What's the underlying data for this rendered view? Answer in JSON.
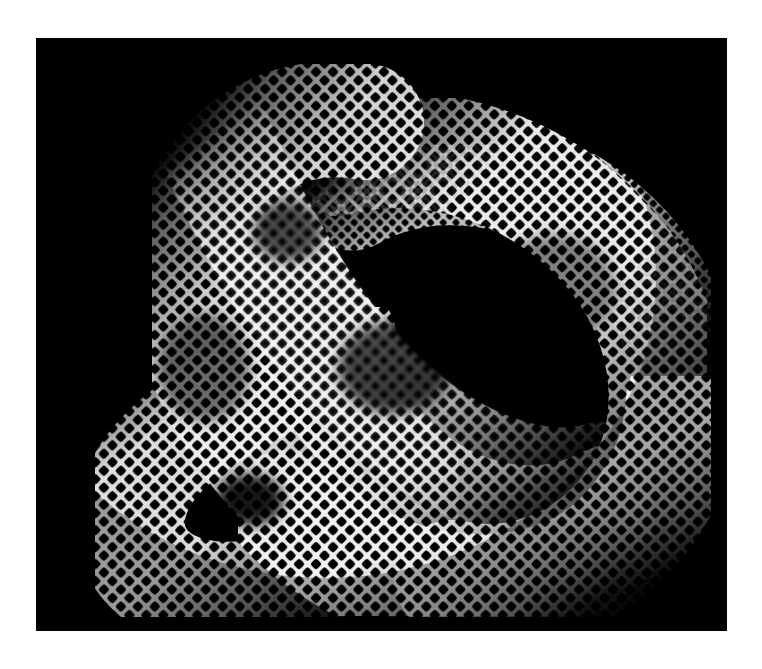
{
  "figure": {
    "render_style": "checkerboard-mesh-tube",
    "background_color": "#000000",
    "page_color": "#ffffff",
    "mesh_color": "#ffffff",
    "cell_color": "#000000"
  },
  "canvas": {
    "left": 36,
    "top": 38,
    "width": 691,
    "height": 593
  },
  "geometry": {
    "type": "torus-knot",
    "p": 3,
    "q": 2,
    "tube_radius": 58,
    "major_radius": 215,
    "center_x": 345,
    "center_y": 290,
    "samples": 900,
    "bbox": {
      "x_min": 34,
      "x_max": 664,
      "y_min": 40,
      "y_max": 562
    }
  },
  "texture": {
    "pattern": "square-grid",
    "cell_pitch_px": 12,
    "line_width_px": 3.6,
    "corner_radius_px": 2.2,
    "rotation_deg": 45
  },
  "shading": {
    "light_direction": "upper-left",
    "highlight_opacity": 1.0,
    "terminator_opacity": 0.0,
    "ambient": 0.04
  },
  "labels": {
    "alt_text": "A white square-mesh textured tube forming a three-lobed torus knot on a black square field."
  }
}
